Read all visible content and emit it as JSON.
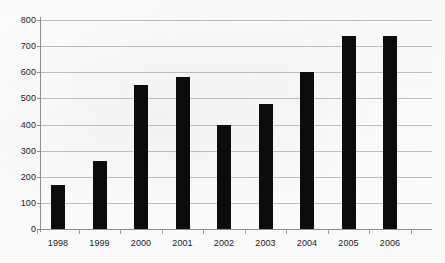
{
  "chart_data": {
    "type": "bar",
    "title": "",
    "subtitle": "",
    "xlabel": "",
    "ylabel": "",
    "categories": [
      "1998",
      "1999",
      "2000",
      "2001",
      "2002",
      "2003",
      "2004",
      "2005",
      "2006"
    ],
    "values": [
      170,
      260,
      550,
      580,
      400,
      480,
      600,
      740,
      740
    ],
    "series": [
      {
        "name": "",
        "values": [
          170,
          260,
          550,
          580,
          400,
          480,
          600,
          740,
          740
        ]
      }
    ],
    "ylim": [
      0,
      800
    ],
    "ytick_labels": [
      "0",
      "100",
      "200",
      "300",
      "400",
      "500",
      "600",
      "700",
      "800"
    ],
    "ytick_values": [
      0,
      100,
      200,
      300,
      400,
      500,
      600,
      700,
      800
    ],
    "grid": true,
    "grid_axis": "y",
    "legend": null,
    "legend_position": "none",
    "annotations": [],
    "colors": {
      "bar": "#0c0c0c",
      "gridline": "#bdbdbd",
      "axis": "#8f8f8f",
      "text": "#1b1b1b",
      "background": "#fdfdfd"
    }
  }
}
